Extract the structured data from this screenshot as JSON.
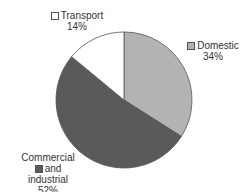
{
  "chart_data": {
    "type": "pie",
    "title": "",
    "start_angle_deg": 0,
    "direction": "clockwise",
    "slices": [
      {
        "label": "Domestic",
        "value": 34,
        "display": "34%",
        "color": "#b3b3b3"
      },
      {
        "label": "Commercial and industrial",
        "value": 52,
        "display": "52%",
        "color": "#5a5a5a"
      },
      {
        "label": "Transport",
        "value": 14,
        "display": "14%",
        "color": "#ffffff"
      }
    ],
    "legend_position": "labels beside slices"
  },
  "labels": {
    "transport": {
      "name": "Transport",
      "pct": "14%"
    },
    "domestic": {
      "name": "Domestic",
      "pct": "34%"
    },
    "commercial": {
      "line1": "Commercial",
      "line2": "and industrial",
      "pct": "52%"
    }
  }
}
